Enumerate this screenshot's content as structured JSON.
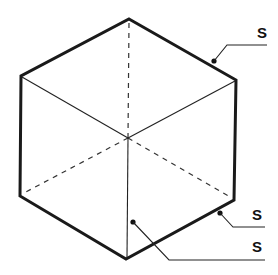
{
  "diagram": {
    "type": "cube-hexagon-projection",
    "labels": [
      {
        "id": "top-right-callout",
        "text": "S"
      },
      {
        "id": "lower-right-callout",
        "text": "S"
      },
      {
        "id": "bottom-callout",
        "text": "S"
      }
    ]
  }
}
